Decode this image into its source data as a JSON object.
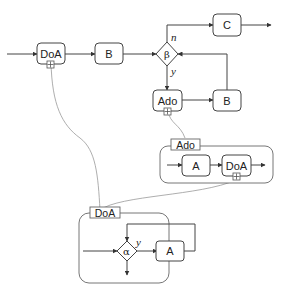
{
  "diagram": {
    "main_flow": {
      "doa_label": "DoA",
      "b_label": "B",
      "c_label": "C",
      "beta_label": "β",
      "ado_label": "Ado",
      "b2_label": "B",
      "branch_n": "n",
      "branch_y": "y"
    },
    "ado_expansion": {
      "title": "Ado",
      "a_label": "A",
      "doa_label": "DoA"
    },
    "doa_expansion": {
      "title": "DoA",
      "alpha_label": "α",
      "branch_y": "y",
      "a_label": "A"
    },
    "colors": {
      "stroke": "#444444",
      "link": "#999999",
      "background": "#ffffff"
    }
  }
}
